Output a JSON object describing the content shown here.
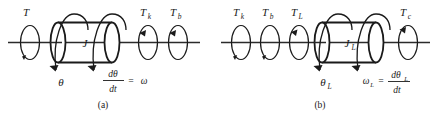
{
  "figure": {
    "name": "rotational-mechanical-system-diagram",
    "panels": [
      {
        "id": "a",
        "caption": "(a)",
        "inertia_label": "J",
        "torques": [
          {
            "name": "torque-T",
            "base": "T",
            "sub": ""
          },
          {
            "name": "torque-Tk",
            "base": "T",
            "sub": "k"
          },
          {
            "name": "torque-Tb",
            "base": "T",
            "sub": "b"
          }
        ],
        "angle_label": {
          "base": "θ",
          "sub": ""
        },
        "equation": {
          "numerator": "dθ",
          "numerator_sub": "",
          "denominator": "dt",
          "equals": "=",
          "result": "ω",
          "result_sub": ""
        }
      },
      {
        "id": "b",
        "caption": "(b)",
        "inertia_label": "J",
        "inertia_sub": "L",
        "torques": [
          {
            "name": "torque-Tk",
            "base": "T",
            "sub": "k"
          },
          {
            "name": "torque-Tb",
            "base": "T",
            "sub": "b"
          },
          {
            "name": "torque-TL",
            "base": "T",
            "sub": "L"
          },
          {
            "name": "torque-Tc",
            "base": "T",
            "sub": "c"
          }
        ],
        "angle_label": {
          "base": "θ",
          "sub": "L"
        },
        "equation": {
          "omega": "ω",
          "omega_sub": "L",
          "equals": "=",
          "numerator": "dθ",
          "numerator_sub": "L",
          "denominator": "dt"
        }
      }
    ],
    "colors": {
      "ink": "#1a1a1a",
      "shaft": "#2b2b2b",
      "background": "#ffffff"
    }
  }
}
